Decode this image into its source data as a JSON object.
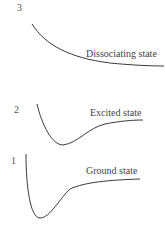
{
  "diagram": {
    "states": [
      {
        "number": "3",
        "label": "Dissociating state"
      },
      {
        "number": "2",
        "label": "Excited state"
      },
      {
        "number": "1",
        "label": "Ground state"
      }
    ],
    "line_color": "#3a3a3a"
  }
}
